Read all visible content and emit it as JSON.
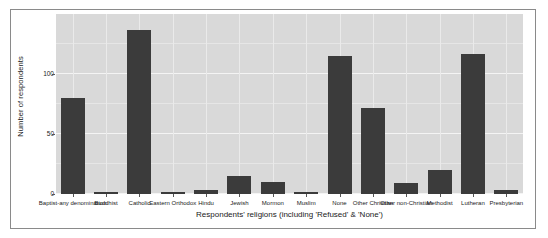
{
  "chart_data": {
    "type": "bar",
    "title": "",
    "xlabel": "Respondents' religions (including 'Refused' & 'None')",
    "ylabel": "Number of respondents",
    "categories": [
      "Baptist-any denomination",
      "Buddhist",
      "Catholic",
      "Eastern Orthodox",
      "Hindu",
      "Jewish",
      "Mormon",
      "Muslim",
      "None",
      "Other Christian",
      "Other non-Christian",
      "Methodist",
      "Lutheran",
      "Presbyterian"
    ],
    "values": [
      80,
      2,
      137,
      2,
      3,
      15,
      10,
      1,
      115,
      72,
      9,
      20,
      117,
      3
    ],
    "ylim": [
      0,
      150
    ],
    "yticks": [
      0,
      50,
      100
    ],
    "ytick_labels": [
      "0",
      "50",
      "100"
    ],
    "grid": true,
    "legend": "none",
    "bar_color": "#3b3b3b",
    "panel_color": "#d9d9d9",
    "grid_color": "#f4f4f4",
    "background_color": "#ffffff"
  }
}
